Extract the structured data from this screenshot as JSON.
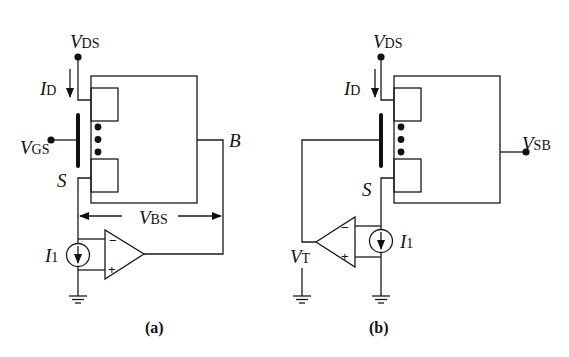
{
  "figure": {
    "panels": [
      {
        "id": "a",
        "caption": "(a)",
        "labels": {
          "vds": {
            "main": "V",
            "sub": "DS"
          },
          "id": {
            "main": "I",
            "sub": "D"
          },
          "vgs": {
            "main": "V",
            "sub": "GS"
          },
          "source": "S",
          "bulk": "B",
          "vbs": {
            "main": "V",
            "sub": "BS"
          },
          "i1": {
            "main": "I",
            "sub": "1"
          }
        },
        "opamp": {
          "minus": "−",
          "plus": "+"
        }
      },
      {
        "id": "b",
        "caption": "(b)",
        "labels": {
          "vds": {
            "main": "V",
            "sub": "DS"
          },
          "id": {
            "main": "I",
            "sub": "D"
          },
          "vsb": {
            "main": "V",
            "sub": "SB"
          },
          "source": "S",
          "vt": {
            "main": "V",
            "sub": "T"
          },
          "i1": {
            "main": "I",
            "sub": "1"
          }
        },
        "opamp": {
          "minus": "−",
          "plus": "+"
        }
      }
    ],
    "colors": {
      "ink": "#111111",
      "background": "#ffffff"
    }
  }
}
